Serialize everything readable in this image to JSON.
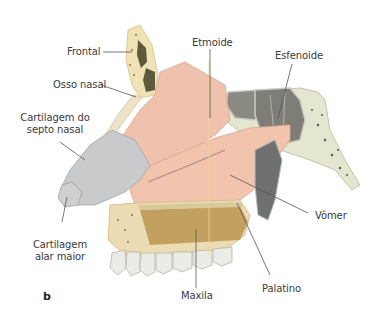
{
  "figure": {
    "panel_letter": "b",
    "labels": {
      "frontal": "Frontal",
      "osso_nasal": "Osso nasal",
      "cartilagem_septo_l1": "Cartilagem do",
      "cartilagem_septo_l2": "septo nasal",
      "cartilagem_alar_l1": "Cartilagem",
      "cartilagem_alar_l2": "alar maior",
      "etmoide": "Etmoide",
      "esfenoide": "Esfenoide",
      "vomer": "Vômer",
      "palatino": "Palatino",
      "maxila": "Maxila"
    },
    "colors": {
      "bone": "#efe2b4",
      "bone_dark": "#b99a5e",
      "septum_mucosa": "#f0c2ad",
      "cartilage": "#c9cacc",
      "sinus": "#7d7d74",
      "tooth": "#ecece6",
      "leader_line": "#555555"
    }
  }
}
